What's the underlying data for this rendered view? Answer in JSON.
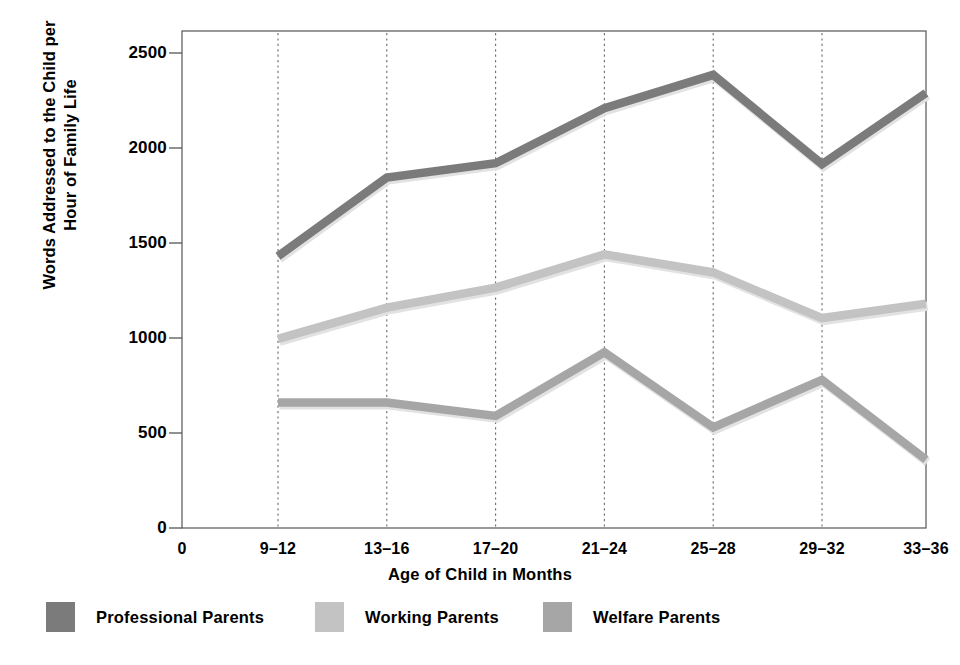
{
  "chart_data": {
    "type": "line",
    "title": "",
    "xlabel": "Age of Child in Months",
    "ylabel": "Words Addressed to the Child per Hour of Family Life",
    "ylabel_lines": [
      "Words Addressed to the Child per",
      "Hour of Family Life"
    ],
    "categories": [
      "9–12",
      "13–16",
      "17–20",
      "21–24",
      "25–28",
      "29–32",
      "33–36"
    ],
    "x_tick_labels": [
      "0",
      "9–12",
      "13–16",
      "17–20",
      "21–24",
      "25–28",
      "29–32",
      "33–36"
    ],
    "y_tick_labels": [
      "0",
      "500",
      "1000",
      "1500",
      "2000",
      "2500"
    ],
    "y_ticks": [
      0,
      500,
      1000,
      1500,
      2000,
      2500
    ],
    "ylim": [
      0,
      2500
    ],
    "grid": "vertical-dotted",
    "legend_position": "below",
    "series": [
      {
        "name": "Professional Parents",
        "color": "#7b7b7b",
        "values": [
          1430,
          1845,
          1920,
          2210,
          2385,
          1915,
          2290
        ]
      },
      {
        "name": "Working Parents",
        "color": "#c3c3c3",
        "values": [
          995,
          1160,
          1265,
          1440,
          1345,
          1105,
          1180
        ]
      },
      {
        "name": "Welfare Parents",
        "color": "#a6a6a6",
        "values": [
          660,
          660,
          590,
          925,
          530,
          780,
          360
        ]
      }
    ]
  },
  "axis": {
    "origin_label": "0"
  },
  "legend": {
    "items": [
      {
        "label": "Professional Parents",
        "color": "#7b7b7b"
      },
      {
        "label": "Working Parents",
        "color": "#c3c3c3"
      },
      {
        "label": "Welfare Parents",
        "color": "#a6a6a6"
      }
    ]
  },
  "colors": {
    "axis": "#555555",
    "grid": "#6b6b6b",
    "text": "#000000",
    "background": "#ffffff"
  }
}
